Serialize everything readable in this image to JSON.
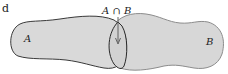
{
  "diagram": {
    "type": "venn",
    "fragment_text": "d",
    "sets": [
      {
        "id": "A",
        "label": "A",
        "fill": "#d9d9d9",
        "stroke": "#3a3a3a"
      },
      {
        "id": "B",
        "label": "B",
        "fill": "#d6d6d6",
        "stroke": "#8a8a8a"
      }
    ],
    "intersection": {
      "label": "A ∩ B",
      "stroke": "#2a2a2a",
      "arrow_color": "#555555"
    }
  }
}
